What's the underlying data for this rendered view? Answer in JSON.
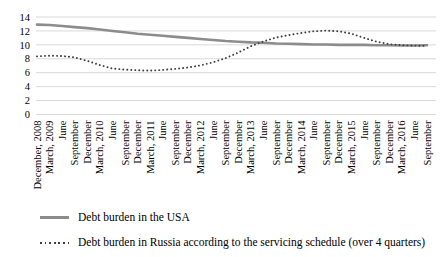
{
  "chart_data": {
    "type": "line",
    "title": "",
    "xlabel": "",
    "ylabel": "",
    "ylim": [
      0,
      14
    ],
    "yticks": [
      0,
      2,
      4,
      6,
      8,
      10,
      12,
      14
    ],
    "grid": "horizontal",
    "gridline_color": "#d9d9d9",
    "axis_text_color": "#000000",
    "legend_position": "bottom-left",
    "categories": [
      "December, 2008",
      "March, 2009",
      "June",
      "September",
      "December",
      "March, 2010",
      "June",
      "September",
      "December",
      "March, 2011",
      "June",
      "September",
      "December",
      "March, 2012",
      "June",
      "September",
      "December",
      "March, 2013",
      "June",
      "September",
      "December",
      "March, 2014",
      "June",
      "September",
      "December",
      "March, 2015",
      "June",
      "September",
      "December",
      "March, 2016",
      "June",
      "September"
    ],
    "series": [
      {
        "name": "Debt burden in the USA",
        "style": "solid",
        "color": "#8c8c8c",
        "values": [
          12.9,
          12.85,
          12.7,
          12.55,
          12.4,
          12.2,
          12.0,
          11.8,
          11.6,
          11.45,
          11.3,
          11.15,
          11.0,
          10.85,
          10.7,
          10.55,
          10.45,
          10.35,
          10.3,
          10.2,
          10.15,
          10.1,
          10.05,
          10.05,
          10.0,
          10.0,
          10.0,
          9.95,
          9.95,
          9.9,
          9.9,
          9.95
        ]
      },
      {
        "name": "Debt burden in Russia according to the servicing schedule (over 4 quarters)",
        "style": "dotted",
        "color": "#3f3f3f",
        "values": [
          8.35,
          8.45,
          8.4,
          8.2,
          7.7,
          7.1,
          6.6,
          6.45,
          6.35,
          6.3,
          6.4,
          6.55,
          6.75,
          7.05,
          7.5,
          8.1,
          8.9,
          9.8,
          10.5,
          11.05,
          11.4,
          11.7,
          11.95,
          12.05,
          11.95,
          11.6,
          11.0,
          10.45,
          10.1,
          9.95,
          9.9,
          9.85
        ]
      }
    ]
  },
  "legend": {
    "items": [
      {
        "label": "Debt burden in the USA"
      },
      {
        "label": "Debt burden in Russia according to the servicing schedule (over 4 quarters)"
      }
    ]
  }
}
